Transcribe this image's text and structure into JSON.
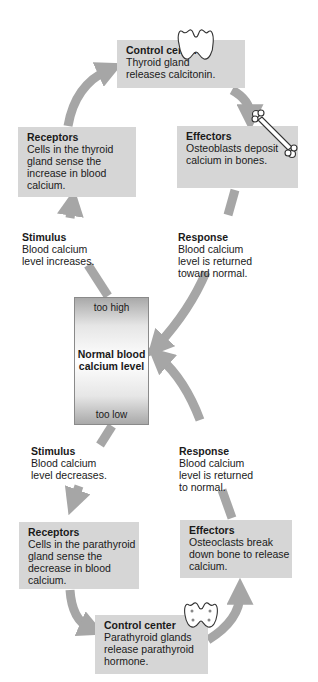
{
  "diagram": {
    "colors": {
      "box": "#d6d6d6",
      "arrow": "#a6a6a6",
      "text": "#1a1a1a"
    },
    "center": {
      "top_label": "too high",
      "main_label": "Normal blood\ncalcium level",
      "bottom_label": "too low"
    },
    "upper_loop": {
      "stimulus": {
        "title": "Stimulus",
        "body": "Blood calcium\nlevel increases."
      },
      "receptors": {
        "title": "Receptors",
        "body": "Cells in the thyroid\ngland sense the\nincrease in blood\ncalcium."
      },
      "control_center": {
        "title": "Control center",
        "body": "Thyroid gland\nreleases calcitonin.",
        "icon": "thyroid-gland-icon"
      },
      "effectors": {
        "title": "Effectors",
        "body": "Osteoblasts deposit\ncalcium in bones.",
        "icon": "bone-icon"
      },
      "response": {
        "title": "Response",
        "body": "Blood calcium\nlevel is returned\ntoward normal."
      }
    },
    "lower_loop": {
      "stimulus": {
        "title": "Stimulus",
        "body": "Blood calcium\nlevel decreases."
      },
      "receptors": {
        "title": "Receptors",
        "body": "Cells in the parathyroid\ngland sense the\ndecrease in blood\ncalcium."
      },
      "control_center": {
        "title": "Control center",
        "body": "Parathyroid glands\nrelease parathyroid\nhormone.",
        "icon": "parathyroid-glands-icon"
      },
      "effectors": {
        "title": "Effectors",
        "body": "Osteoclasts break\ndown bone to release\ncalcium."
      },
      "response": {
        "title": "Response",
        "body": "Blood calcium\nlevel is returned\nto normal."
      }
    }
  }
}
